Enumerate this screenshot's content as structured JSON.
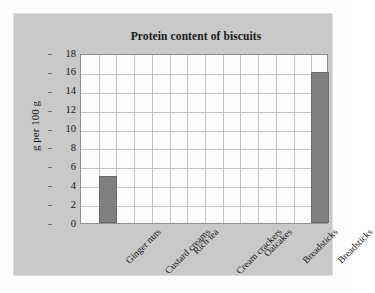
{
  "chart_data": {
    "type": "bar",
    "title": "Protein content of biscuits",
    "xlabel": "",
    "ylabel": "g per 100 g",
    "categories": [
      "Ginger nuts",
      "Custard creams",
      "Rich tea",
      "Cream crackers",
      "Oatcakes",
      "Breadsticks",
      "Breadsticks"
    ],
    "values": [
      5,
      0,
      0,
      0,
      0,
      0,
      16
    ],
    "ylim": [
      0,
      18
    ],
    "ytick_step": 2,
    "yticks": [
      18,
      16,
      14,
      12,
      10,
      8,
      6,
      4,
      2,
      0
    ],
    "grid": true,
    "legend": "none",
    "bar_color": "#808080",
    "panel_color": "#c9c9c9",
    "plot_background": "#fefefe",
    "gridline_color": "#c4c4c4"
  }
}
